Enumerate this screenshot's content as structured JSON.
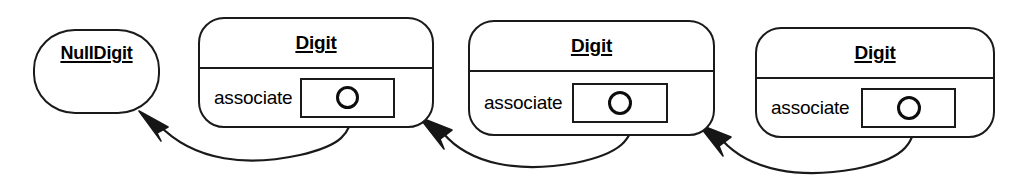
{
  "diagram": {
    "type": "uml-object-diagram",
    "background_color": "#ffffff",
    "line_color": "#1a1a1a",
    "text_color": "#000000",
    "nodes": [
      {
        "id": "nulldigit",
        "title": "NullDigit",
        "title_style": "bold-underline",
        "compartments": 1,
        "attributes": []
      },
      {
        "id": "digit-1",
        "title": "Digit",
        "title_style": "bold-underline",
        "compartments": 2,
        "attributes": [
          {
            "name": "associate",
            "link_end": "circle"
          }
        ]
      },
      {
        "id": "digit-2",
        "title": "Digit",
        "title_style": "bold-underline",
        "compartments": 2,
        "attributes": [
          {
            "name": "associate",
            "link_end": "circle"
          }
        ]
      },
      {
        "id": "digit-3",
        "title": "Digit",
        "title_style": "bold-underline",
        "compartments": 2,
        "attributes": [
          {
            "name": "associate",
            "link_end": "circle"
          }
        ]
      }
    ],
    "links": [
      {
        "from": "digit-1",
        "from_port": "associate",
        "to": "nulldigit",
        "arrow": "filled-triangle",
        "style": "curved"
      },
      {
        "from": "digit-2",
        "from_port": "associate",
        "to": "digit-1",
        "arrow": "filled-triangle",
        "style": "curved"
      },
      {
        "from": "digit-3",
        "from_port": "associate",
        "to": "digit-2",
        "arrow": "filled-triangle",
        "style": "curved"
      }
    ]
  }
}
